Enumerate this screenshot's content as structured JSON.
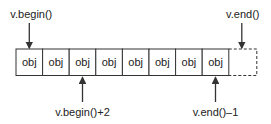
{
  "cells": [
    "obj",
    "obj",
    "obj",
    "obj",
    "obj",
    "obj",
    "obj",
    "obj"
  ],
  "past_the_end_cell": "",
  "pointers": [
    {
      "label": "v.begin()",
      "target_index": 0,
      "side": "top"
    },
    {
      "label": "v.end()",
      "target_index": 8,
      "side": "top"
    },
    {
      "label": "v.begin()+2",
      "target_index": 2,
      "side": "bottom"
    },
    {
      "label": "v.end()–1",
      "target_index": 7,
      "side": "bottom"
    }
  ],
  "colors": {
    "line": "#333333",
    "text": "#222222",
    "background": "#ffffff"
  }
}
